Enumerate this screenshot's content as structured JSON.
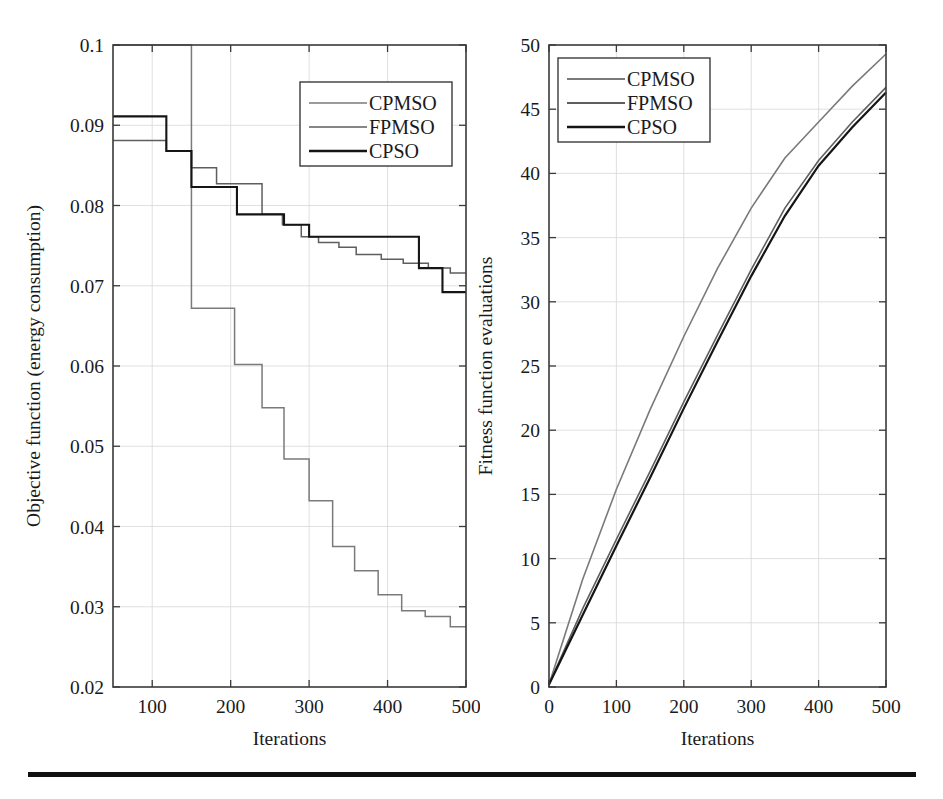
{
  "figure": {
    "title": "",
    "footer_rule": true,
    "background": "#ffffff",
    "ink": "#1a1a1a"
  },
  "colors": {
    "cpmso": "#7a7a7a",
    "fpmso": "#5e5e5e",
    "cpso": "#151515",
    "grid": "#d8d8d8",
    "axis": "#3a3a3a"
  },
  "chart_data": [
    {
      "id": "left",
      "type": "line",
      "title": "",
      "xlabel": "Iterations",
      "ylabel": "Objective function (energy consumption)",
      "xlim": [
        50,
        500
      ],
      "ylim": [
        0.02,
        0.1
      ],
      "xticks": [
        100,
        200,
        300,
        400,
        500
      ],
      "xticklabels": [
        "100",
        "200",
        "300",
        "400",
        "500"
      ],
      "yticks": [
        0.02,
        0.03,
        0.04,
        0.05,
        0.06,
        0.07,
        0.08,
        0.09,
        0.1
      ],
      "yticklabels": [
        "0.02",
        "0.03",
        "0.04",
        "0.05",
        "0.06",
        "0.07",
        "0.08",
        "0.09",
        "0.1"
      ],
      "grid": true,
      "drawstyle": "steps-post",
      "legend": {
        "position": "upper-right",
        "entries": [
          "CPMSO",
          "FPMSO",
          "CPSO"
        ]
      },
      "series": [
        {
          "name": "CPMSO",
          "color": "#7a7a7a",
          "width": 1.5,
          "x": [
            50,
            120,
            150,
            175,
            205,
            240,
            268,
            300,
            330,
            358,
            388,
            418,
            448,
            480,
            500
          ],
          "values": [
            0.1,
            0.1,
            0.0672,
            0.0672,
            0.0602,
            0.0548,
            0.0484,
            0.0432,
            0.0375,
            0.0345,
            0.0315,
            0.0295,
            0.0288,
            0.0275,
            0.0275
          ]
        },
        {
          "name": "FPMSO",
          "color": "#5e5e5e",
          "width": 1.5,
          "x": [
            50,
            82,
            118,
            150,
            182,
            208,
            240,
            266,
            290,
            312,
            338,
            360,
            392,
            420,
            452,
            480,
            500
          ],
          "values": [
            0.0881,
            0.0881,
            0.0868,
            0.0847,
            0.0827,
            0.0827,
            0.0789,
            0.0776,
            0.0761,
            0.0754,
            0.0748,
            0.0739,
            0.0733,
            0.0728,
            0.0722,
            0.0716,
            0.0716
          ]
        },
        {
          "name": "CPSO",
          "color": "#151515",
          "width": 2.1,
          "x": [
            50,
            82,
            118,
            150,
            182,
            208,
            240,
            268,
            300,
            340,
            380,
            416,
            440,
            470,
            500
          ],
          "values": [
            0.0911,
            0.0911,
            0.0868,
            0.0823,
            0.0823,
            0.0789,
            0.0789,
            0.0776,
            0.0761,
            0.0761,
            0.0761,
            0.0761,
            0.0722,
            0.0692,
            0.0692
          ]
        }
      ]
    },
    {
      "id": "right",
      "type": "line",
      "title": "",
      "xlabel": "Iterations",
      "ylabel": "Fitness function evaluations",
      "xlim": [
        0,
        500
      ],
      "ylim": [
        0,
        50
      ],
      "xticks": [
        0,
        100,
        200,
        300,
        400,
        500
      ],
      "xticklabels": [
        "0",
        "100",
        "200",
        "300",
        "400",
        "500"
      ],
      "yticks": [
        0,
        5,
        10,
        15,
        20,
        25,
        30,
        35,
        40,
        45,
        50
      ],
      "yticklabels": [
        "0",
        "5",
        "10",
        "15",
        "20",
        "25",
        "30",
        "35",
        "40",
        "45",
        "50"
      ],
      "grid": true,
      "drawstyle": "default",
      "legend": {
        "position": "upper-left",
        "entries": [
          "CPMSO",
          "FPMSO",
          "CPSO"
        ]
      },
      "series": [
        {
          "name": "CPMSO",
          "color": "#7a7a7a",
          "width": 1.6,
          "x": [
            0,
            50,
            100,
            150,
            200,
            250,
            300,
            350,
            400,
            450,
            500
          ],
          "values": [
            0.2,
            8.4,
            15.4,
            21.6,
            27.3,
            32.6,
            37.3,
            41.2,
            44.0,
            46.8,
            49.3
          ]
        },
        {
          "name": "FPMSO",
          "color": "#5e5e5e",
          "width": 1.6,
          "x": [
            0,
            50,
            100,
            150,
            200,
            250,
            300,
            350,
            400,
            450,
            500
          ],
          "values": [
            0.2,
            6.1,
            11.5,
            16.8,
            22.2,
            27.4,
            32.5,
            37.3,
            41.0,
            44.0,
            46.7
          ]
        },
        {
          "name": "CPSO",
          "color": "#151515",
          "width": 2.2,
          "x": [
            0,
            50,
            100,
            150,
            200,
            250,
            300,
            350,
            400,
            450,
            500
          ],
          "values": [
            0.2,
            5.6,
            11.0,
            16.3,
            21.7,
            26.9,
            32.0,
            36.7,
            40.6,
            43.6,
            46.3
          ]
        }
      ]
    }
  ]
}
